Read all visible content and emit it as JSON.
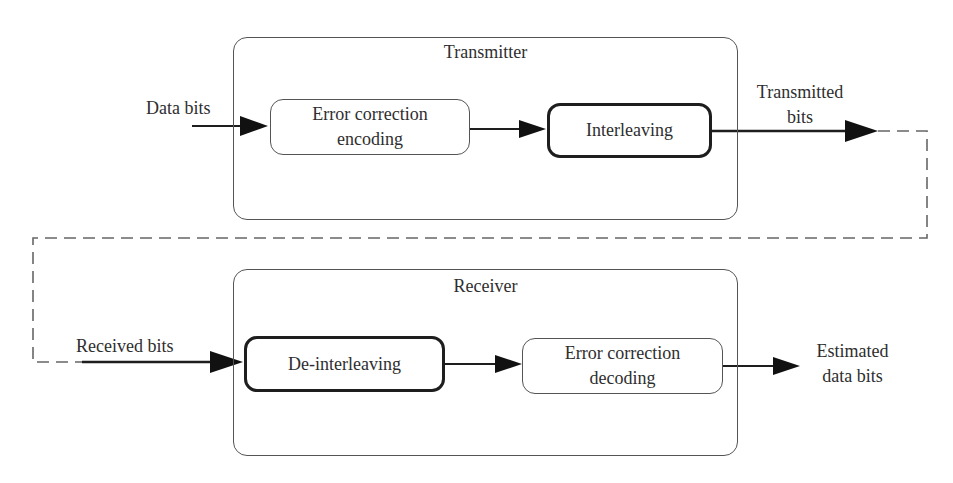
{
  "diagram": {
    "transmitter": {
      "title": "Transmitter",
      "blocks": [
        {
          "id": "encoding",
          "line1": "Error correction",
          "line2": "encoding",
          "style": "thin"
        },
        {
          "id": "interleaving",
          "line1": "Interleaving",
          "style": "thick"
        }
      ]
    },
    "receiver": {
      "title": "Receiver",
      "blocks": [
        {
          "id": "deinterleaving",
          "line1": "De-interleaving",
          "style": "thick"
        },
        {
          "id": "decoding",
          "line1": "Error correction",
          "line2": "decoding",
          "style": "thin"
        }
      ]
    },
    "labels": {
      "data_bits": "Data bits",
      "transmitted_bits_line1": "Transmitted",
      "transmitted_bits_line2": "bits",
      "received_bits": "Received bits",
      "estimated_line1": "Estimated",
      "estimated_line2": "data bits"
    },
    "edges": [
      {
        "from": "Data bits",
        "to": "encoding",
        "style": "solid"
      },
      {
        "from": "encoding",
        "to": "interleaving",
        "style": "solid"
      },
      {
        "from": "interleaving",
        "to": "Transmitted bits",
        "style": "solid"
      },
      {
        "from": "Transmitted bits",
        "to": "Received bits",
        "style": "dashed",
        "note": "channel"
      },
      {
        "from": "Received bits",
        "to": "deinterleaving",
        "style": "solid"
      },
      {
        "from": "deinterleaving",
        "to": "decoding",
        "style": "solid"
      },
      {
        "from": "decoding",
        "to": "Estimated data bits",
        "style": "solid"
      }
    ],
    "colors": {
      "stroke": "#1e1e1e",
      "container_border": "#555555",
      "dashed": "#666666",
      "text": "#2e2e2e"
    }
  }
}
